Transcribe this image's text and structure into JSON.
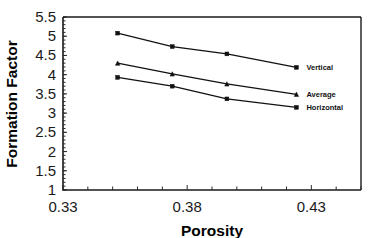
{
  "chart_data": {
    "type": "line",
    "title": "",
    "xlabel": "Porosity",
    "ylabel": "Formation Factor",
    "xlim": [
      0.33,
      0.45
    ],
    "ylim": [
      1,
      5.5
    ],
    "grid": false,
    "legend_position": "inline-right-annotations",
    "x_ticks_labeled": [
      "0.33",
      "0.38",
      "0.43"
    ],
    "x_ticks_labeled_values": [
      0.33,
      0.38,
      0.43
    ],
    "x_minor_tick_step": 0.01,
    "y_ticks": [
      "1",
      "1.5",
      "2",
      "2.5",
      "3",
      "3.5",
      "4",
      "4.5",
      "5",
      "5.5"
    ],
    "y_tick_values": [
      1,
      1.5,
      2,
      2.5,
      3,
      3.5,
      4,
      4.5,
      5,
      5.5
    ],
    "x": [
      0.352,
      0.374,
      0.396,
      0.424
    ],
    "series": [
      {
        "name": "Vertical",
        "values": [
          5.08,
          4.73,
          4.54,
          4.19
        ],
        "marker": "square",
        "color": "#111111"
      },
      {
        "name": "Average",
        "values": [
          4.3,
          4.02,
          3.76,
          3.49
        ],
        "marker": "triangle",
        "color": "#111111"
      },
      {
        "name": "Horizontal",
        "values": [
          3.93,
          3.7,
          3.37,
          3.15
        ],
        "marker": "square",
        "color": "#111111"
      }
    ]
  }
}
